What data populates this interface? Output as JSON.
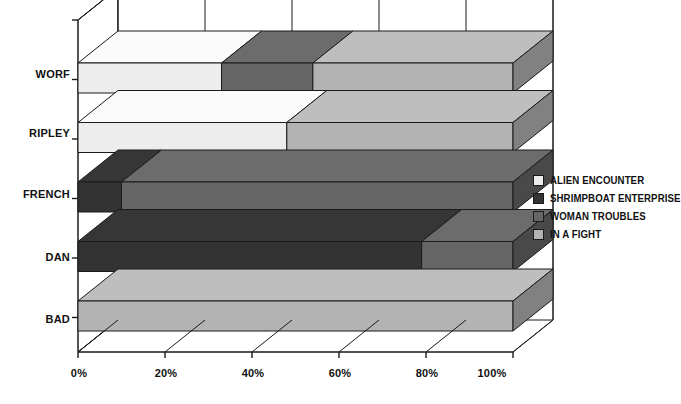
{
  "chart_data": {
    "type": "bar",
    "orientation": "horizontal",
    "stacked": true,
    "three_d": true,
    "title": "",
    "subtitle": "",
    "xlabel": "",
    "ylabel": "",
    "categories": [
      "WORF",
      "RIPLEY",
      "FRENCH",
      "DAN",
      "BAD"
    ],
    "series": [
      {
        "name": "ALIEN ENCOUNTER",
        "color": "#ededed",
        "values": [
          33,
          48,
          0,
          0,
          0
        ]
      },
      {
        "name": "SHRIMPBOAT ENTERPRISE",
        "color": "#333333",
        "values": [
          0,
          0,
          10,
          79,
          0
        ]
      },
      {
        "name": "WOMAN TROUBLES",
        "color": "#666666",
        "values": [
          21,
          0,
          90,
          21,
          0
        ]
      },
      {
        "name": "IN A FIGHT",
        "color": "#b3b3b3",
        "values": [
          46,
          52,
          0,
          0,
          100
        ]
      }
    ],
    "xticks": [
      "0%",
      "20%",
      "40%",
      "60%",
      "80%",
      "100%"
    ],
    "xtick_values": [
      0,
      20,
      40,
      60,
      80,
      100
    ],
    "xlim": [
      0,
      100
    ],
    "grid": true,
    "legend_position": "right",
    "legend_entries": [
      {
        "label": "ALIEN ENCOUNTER",
        "color": "#ededed"
      },
      {
        "label": "SHRIMPBOAT ENTERPRISE",
        "color": "#333333"
      },
      {
        "label": "WOMAN TROUBLES",
        "color": "#666666"
      },
      {
        "label": "IN A FIGHT",
        "color": "#b3b3b3"
      }
    ],
    "axis_color": "#1a1a1a",
    "background_color": "#ffffff"
  }
}
